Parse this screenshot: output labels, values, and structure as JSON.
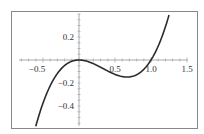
{
  "chart_data": {
    "type": "line",
    "title": "",
    "xlabel": "",
    "ylabel": "",
    "function": "x^3 - x^2",
    "xlim": [
      -0.6,
      1.25
    ],
    "ylim": [
      -0.55,
      0.39
    ],
    "x_ticks": [
      "-0.5",
      "0.5",
      "1.0",
      "1.5"
    ],
    "y_ticks": [
      "0.2",
      "-0.2",
      "-0.4"
    ],
    "grid": false,
    "legend": null,
    "series": [
      {
        "name": "f(x)",
        "x": [
          -0.6,
          -0.5,
          -0.4,
          -0.3,
          -0.2,
          -0.1,
          0.0,
          0.1,
          0.2,
          0.3,
          0.4,
          0.5,
          0.6,
          0.667,
          0.7,
          0.8,
          0.9,
          1.0,
          1.1,
          1.2,
          1.25
        ],
        "values": [
          -0.576,
          -0.375,
          -0.224,
          -0.117,
          -0.048,
          -0.011,
          0.0,
          -0.009,
          -0.032,
          -0.063,
          -0.096,
          -0.125,
          -0.144,
          -0.148,
          -0.147,
          -0.128,
          -0.081,
          0.0,
          0.121,
          0.288,
          0.391
        ]
      }
    ],
    "colors": {
      "curve": "#2b2b2b",
      "axes": "#aaaaaa",
      "frame": "#888888"
    }
  },
  "labels": {
    "x": [
      "-0.5",
      "0.5",
      "1.0",
      "1.5"
    ],
    "y": [
      "0.2",
      "-0.2",
      "-0.4"
    ]
  }
}
